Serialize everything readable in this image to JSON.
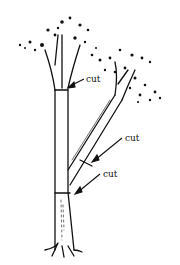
{
  "figure": {
    "labels": [
      {
        "text": "cut",
        "x": 86,
        "y": 82
      },
      {
        "text": "cut",
        "x": 125,
        "y": 141
      },
      {
        "text": "cut",
        "x": 103,
        "y": 177
      }
    ],
    "colors": {
      "ink": "#111111",
      "background": "#ffffff"
    }
  }
}
